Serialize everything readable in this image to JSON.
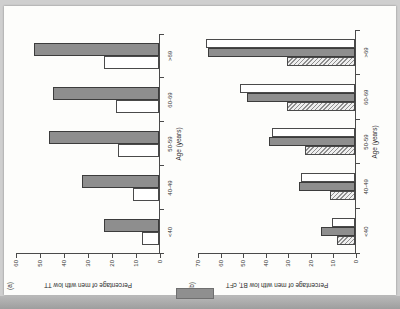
{
  "page": {
    "background_color": "#cfcfcf",
    "sheet_color": "#fdfdfb"
  },
  "figure": {
    "panel_a_label": "(a)",
    "panel_b_label": "(b)"
  },
  "colors": {
    "grey_bar": "#8e8e8e",
    "white_bar": "#ffffff",
    "hatched_bar": "#efefef",
    "axis": "#4a4a4a",
    "text": "#2b2b2b"
  },
  "chart_data": [
    {
      "id": "panel-a",
      "type": "bar",
      "title": "(a)",
      "xlabel": "Age (years)",
      "ylabel": "Percentage of men with low TT",
      "categories": [
        "<40",
        "40-49",
        "50-59",
        "60-69",
        ">69"
      ],
      "ylim": [
        0,
        60
      ],
      "yticks": [
        0,
        10,
        20,
        30,
        40,
        50,
        60
      ],
      "ytick_labels": [
        "0",
        "10",
        "20",
        "30",
        "40",
        "50",
        "60"
      ],
      "grid": false,
      "legend": false,
      "series": [
        {
          "name": "white",
          "style": "white",
          "values": [
            7,
            11,
            17,
            18,
            23
          ]
        },
        {
          "name": "grey",
          "style": "grey",
          "values": [
            23,
            32,
            46,
            44,
            52
          ]
        }
      ]
    },
    {
      "id": "panel-b",
      "type": "bar",
      "title": "(b)",
      "xlabel": "Age (years)",
      "ylabel": "Percentage of men with low BT, cFT",
      "categories": [
        "<40",
        "40-49",
        "50-59",
        "60-69",
        ">69"
      ],
      "ylim": [
        0,
        70
      ],
      "yticks": [
        0,
        10,
        20,
        30,
        40,
        50,
        60,
        70
      ],
      "ytick_labels": [
        "0",
        "10",
        "20",
        "30",
        "40",
        "50",
        "60",
        "70"
      ],
      "grid": false,
      "legend": false,
      "series": [
        {
          "name": "hatched",
          "style": "hatch",
          "values": [
            8,
            11,
            22,
            30,
            30
          ]
        },
        {
          "name": "grey",
          "style": "grey",
          "values": [
            15,
            25,
            38,
            48,
            65
          ]
        },
        {
          "name": "white",
          "style": "white",
          "values": [
            10,
            24,
            37,
            51,
            66
          ]
        }
      ]
    }
  ]
}
